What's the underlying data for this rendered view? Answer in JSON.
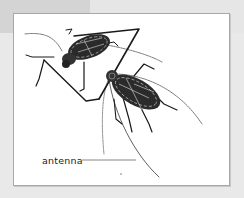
{
  "figure": {
    "labels": [
      {
        "text": "antenna",
        "points_to": "antenna of lower beetle"
      }
    ]
  },
  "colors": {
    "background": "#e6e6e6",
    "frame_fill": "#ffffff",
    "frame_border": "#a8a8a8",
    "ink": "#1a1a1a"
  }
}
